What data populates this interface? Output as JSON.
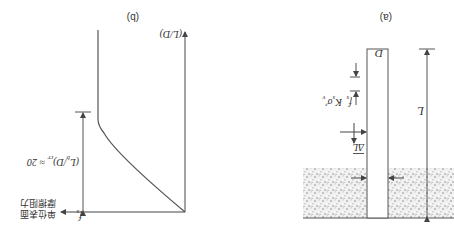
{
  "figure": {
    "orientation": "rotated 180 degrees",
    "panel_a": {
      "label": "(a)",
      "pile_length_label": "L",
      "pile_diameter_label": "D",
      "segment_label": "ΔL",
      "skin_friction_label": "f",
      "skin_friction_subscript": "s",
      "skin_friction_expression": "K",
      "expression_subscript": "s",
      "expression_sigma": "σ′",
      "expression_sigma_subscript": "v",
      "soil_color": "#8a8a8a",
      "line_color": "#555555"
    },
    "panel_b": {
      "label": "(b)",
      "y_axis_label": "(L/D)",
      "x_axis_symbol": "f",
      "x_axis_subscript": "s",
      "x_axis_label_line1": "单位表面",
      "x_axis_label_line2": "摩擦阻力",
      "critical_ratio_label": "(L",
      "critical_ratio_sub": "b",
      "critical_ratio_rest": "/D)",
      "critical_ratio_cr": "cr",
      "critical_ratio_value": "≈ 20",
      "line_color": "#555555"
    }
  }
}
